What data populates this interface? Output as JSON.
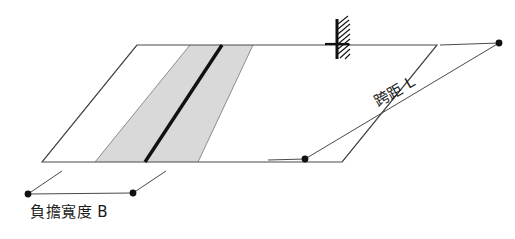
{
  "figure": {
    "background_color": "#ffffff",
    "slab": {
      "name": "floor-slab-parallelogram",
      "outline_color": "#4a4a4a",
      "fill_color": "#ffffff"
    },
    "tributary_band": {
      "name": "tributary-area-band",
      "fill_color": "#d9d9d9",
      "edge_color": "#8c8c8c"
    },
    "beam": {
      "name": "beam-center-line",
      "color": "#111111",
      "thickness_px": 3
    },
    "support": {
      "name": "fixed-support-hatch",
      "color": "#111111",
      "hatch_lines": 9
    },
    "dimensions": {
      "span": {
        "label": "跨距 L",
        "symbol": "L",
        "line_color": "#4a4a4a",
        "marker_color": "#111111",
        "rotation_deg": -30.3
      },
      "width": {
        "label": "負擔寬度 B",
        "symbol": "B",
        "line_color": "#4a4a4a",
        "marker_color": "#111111",
        "rotation_deg": 0
      }
    }
  }
}
